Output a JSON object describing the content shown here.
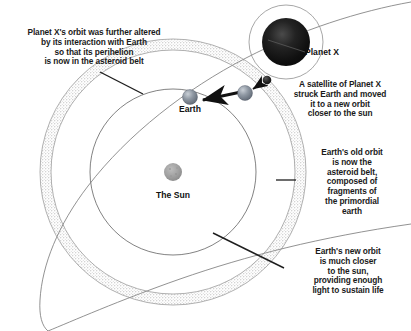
{
  "diagram": {
    "background_color": "#ffffff",
    "annotations": {
      "planetx_orbit": "Planet X's orbit was further altered\nby its interaction with Earth\nso that its perihelion\nis now in the asteroid belt",
      "satellite_impact": "A satellite of Planet X\nstruck Earth and moved\nit to a new orbit\ncloser to the sun",
      "asteroid_belt": "Earth's old orbit\nis now the\nasteroid belt,\ncomposed of\nfragments of\nthe primordial\nearth",
      "earth_new_orbit": "Earth's new orbit\nis much closer\nto the sun,\nproviding enough\nlight to sustain life"
    },
    "body_labels": {
      "earth": "Earth",
      "sun": "The Sun",
      "planet_x": "Planet X"
    },
    "bottom_caption_fragment": "",
    "colors": {
      "line": "#555555",
      "belt_dots": "#9a9a9a",
      "arrow": "#111111",
      "text": "#1a1a1a",
      "sun_fill": "#9e9e9e",
      "earth_fill": "#8c94a0",
      "planet_x_fill": "#1c1c1c",
      "satellite_fill": "#232323"
    },
    "objects": {
      "sun": {
        "cx": 173,
        "cy": 172,
        "r": 9
      },
      "earth_new": {
        "cx": 190,
        "cy": 97,
        "r": 7
      },
      "earth_old": {
        "cx": 245,
        "cy": 93,
        "r": 7
      },
      "satellite": {
        "cx": 267,
        "cy": 80,
        "r": 4
      },
      "planet_x": {
        "cx": 286,
        "cy": 42,
        "r": 24
      },
      "planet_x_halo": {
        "cx": 286,
        "cy": 42,
        "r": 37
      },
      "earth_new_orbit": {
        "cx": 173,
        "cy": 172,
        "r": 83
      },
      "asteroid_belt_inner": {
        "cx": 173,
        "cy": 172,
        "r": 122
      },
      "asteroid_belt_outer": {
        "cx": 173,
        "cy": 172,
        "r": 133
      }
    }
  }
}
